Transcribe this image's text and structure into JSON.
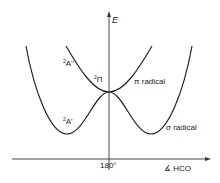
{
  "diagram": {
    "type": "potential energy curves",
    "y_axis_label": "E",
    "x_axis_label": "∡ HCO",
    "x_tick_label": "180°",
    "states": {
      "upper_left": {
        "sup": "2",
        "label": "A''"
      },
      "lower_left": {
        "sup": "2",
        "label": "A'"
      },
      "crossing": {
        "sup": "2",
        "label": "Π"
      }
    },
    "annotations": {
      "pi_radical": "π radical",
      "sigma_radical": "σ radical"
    },
    "colors": {
      "line": "#222222",
      "axis": "#333333",
      "background": "#ffffff"
    }
  }
}
